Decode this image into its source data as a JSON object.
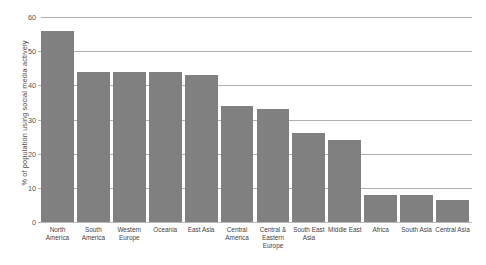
{
  "chart_data": {
    "type": "bar",
    "title": "",
    "subtitle": "",
    "xlabel": "",
    "ylabel": "% of population using social media actively",
    "ylim": [
      0,
      60
    ],
    "yticks": [
      0,
      10,
      20,
      30,
      40,
      50,
      60
    ],
    "ytick_labels": [
      "0",
      "10",
      "20",
      "30",
      "40",
      "50",
      "60"
    ],
    "grid": true,
    "legend": false,
    "legend_position": "none",
    "bar_color": "#808080",
    "gridline_color": "#b0b0b0",
    "categories": [
      "North America",
      "South America",
      "Western Europe",
      "Oceania",
      "East Asia",
      "Central America",
      "Central & Eastern Europe",
      "South East Asia",
      "Middle East",
      "Africa",
      "South Asia",
      "Central Asia"
    ],
    "values": [
      56,
      44,
      44,
      44,
      43,
      34,
      33,
      26,
      24,
      8,
      8,
      6.5
    ]
  }
}
